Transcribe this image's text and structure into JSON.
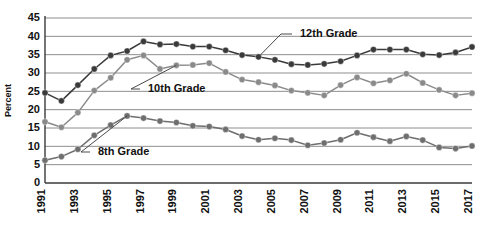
{
  "chart_data": {
    "type": "line",
    "title": "",
    "subtitle": "",
    "xlabel": "",
    "ylabel": "Percent",
    "ylim": [
      0,
      45
    ],
    "ytick_step": 5,
    "yticks": [
      "45",
      "40",
      "35",
      "30",
      "25",
      "20",
      "15",
      "10",
      "5",
      "0"
    ],
    "grid": true,
    "legend_position": "inline-callout",
    "x": [
      1991,
      1992,
      1993,
      1994,
      1995,
      1996,
      1997,
      1998,
      1999,
      2000,
      2001,
      2002,
      2003,
      2004,
      2005,
      2006,
      2007,
      2008,
      2009,
      2010,
      2011,
      2012,
      2013,
      2014,
      2015,
      2016,
      2017
    ],
    "xticks": [
      "1991",
      "1993",
      "1995",
      "1997",
      "1999",
      "2001",
      "2003",
      "2005",
      "2007",
      "2009",
      "2011",
      "2013",
      "2015",
      "2017"
    ],
    "xlim": [
      1991,
      2017
    ],
    "series": [
      {
        "name": "12th Grade",
        "color": "#3a3a3a",
        "label_anchor_year": 2004,
        "values": [
          24.6,
          22.4,
          26.7,
          31.1,
          34.8,
          36.0,
          38.6,
          37.8,
          37.9,
          37.2,
          37.2,
          36.2,
          34.9,
          34.4,
          33.6,
          32.4,
          32.2,
          32.5,
          33.2,
          34.8,
          36.4,
          36.4,
          36.4,
          35.1,
          34.9,
          35.6,
          37.1
        ]
      },
      {
        "name": "10th Grade",
        "color": "#8a8a8a",
        "label_anchor_year": 1999,
        "values": [
          16.7,
          15.2,
          19.2,
          25.2,
          28.7,
          33.6,
          34.8,
          31.1,
          32.1,
          32.2,
          32.7,
          30.3,
          28.2,
          27.5,
          26.6,
          25.2,
          24.6,
          23.9,
          26.7,
          28.8,
          27.2,
          28.0,
          29.8,
          27.3,
          25.4,
          23.9,
          24.5
        ]
      },
      {
        "name": "8th Grade",
        "color": "#6e6e6e",
        "label_anchor_year": 1996,
        "values": [
          6.2,
          7.2,
          9.2,
          13.0,
          15.8,
          18.3,
          17.7,
          16.9,
          16.5,
          15.6,
          15.4,
          14.6,
          12.8,
          11.8,
          12.2,
          11.7,
          10.3,
          10.9,
          11.8,
          13.7,
          12.5,
          11.4,
          12.7,
          11.7,
          9.7,
          9.4,
          10.1
        ]
      }
    ],
    "annotations": [
      {
        "text": "12th Grade",
        "series": "12th Grade"
      },
      {
        "text": "10th Grade",
        "series": "10th Grade"
      },
      {
        "text": "8th Grade",
        "series": "8th Grade"
      }
    ]
  }
}
